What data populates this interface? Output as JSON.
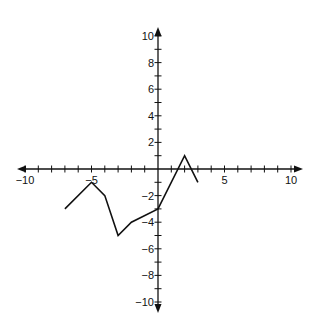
{
  "chart_data": {
    "type": "line",
    "title": "",
    "xlabel": "",
    "ylabel": "",
    "xlim": [
      -10,
      10
    ],
    "ylim": [
      -10,
      10
    ],
    "grid": false,
    "legend": null,
    "x_tick_labels": [
      "-10",
      "-5",
      "5",
      "10"
    ],
    "x_tick_values": [
      -10,
      -5,
      5,
      10
    ],
    "y_tick_labels": [
      "10",
      "8",
      "6",
      "4",
      "2",
      "-2",
      "-4",
      "-6",
      "-8",
      "-10"
    ],
    "y_tick_values": [
      10,
      8,
      6,
      4,
      2,
      -2,
      -4,
      -6,
      -8,
      -10
    ],
    "minor_ticks_every": 1,
    "series": [
      {
        "name": "piecewise line",
        "x": [
          -7,
          -5,
          -4,
          -3,
          -2,
          0,
          2,
          3
        ],
        "y": [
          -3,
          -1,
          -2,
          -5,
          -4,
          -3,
          1,
          -1
        ]
      }
    ],
    "colors": {
      "axis": "#111111",
      "line": "#111111",
      "background": "#ffffff"
    }
  }
}
